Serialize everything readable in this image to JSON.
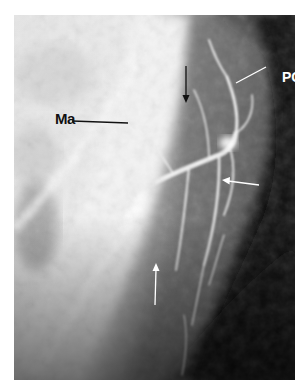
{
  "figure": {
    "type": "radiograph",
    "labels": [
      {
        "id": "ma",
        "text": "Ma",
        "color": "#111111"
      },
      {
        "id": "pg",
        "text": "PG",
        "color": "#ffffff"
      }
    ],
    "arrows": [
      {
        "id": "arrow-black-down",
        "color": "#111111",
        "direction": "down"
      },
      {
        "id": "arrow-white-left",
        "color": "#ffffff",
        "direction": "left"
      },
      {
        "id": "arrow-white-up",
        "color": "#ffffff",
        "direction": "up"
      }
    ],
    "colors": {
      "bright_tissue": "#f2f2f2",
      "mid_tissue": "#9a9a9a",
      "background_dark": "#111111"
    }
  }
}
